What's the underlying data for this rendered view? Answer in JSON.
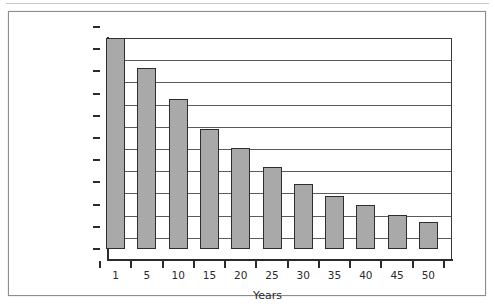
{
  "figure": {
    "background_color": "#ffffff",
    "frame_color": "#8d8d8d",
    "bar_fill_color": "#a9a9a9",
    "bar_edge_color": "#2e2e2e",
    "axis_color": "#2b2b2b",
    "gridline_color": "#5a5a5a"
  },
  "chart_data": {
    "type": "bar",
    "title": "",
    "subtitle": "",
    "xlabel": "Years",
    "ylabel": "",
    "categories": [
      "1",
      "5",
      "10",
      "15",
      "20",
      "25",
      "30",
      "35",
      "40",
      "45",
      "50"
    ],
    "values": [
      95000,
      81500,
      67500,
      54000,
      45500,
      37000,
      29500,
      24000,
      20000,
      15500,
      12000
    ],
    "ylim": [
      0,
      100000
    ],
    "ytick_values": [
      0,
      10000,
      20000,
      30000,
      40000,
      50000,
      60000,
      70000,
      80000,
      90000,
      100000
    ],
    "ytick_labels": [
      "$0",
      "$10,000",
      "$20,000",
      "$30,000",
      "$40,000",
      "$50,000",
      "$60,000",
      "$70,000",
      "$80,000",
      "$90,000",
      "$100,000"
    ],
    "xtick_labels": [
      "1",
      "5",
      "10",
      "15",
      "20",
      "25",
      "30",
      "35",
      "40",
      "45",
      "50"
    ],
    "grid": true,
    "grid_axis": "y",
    "legend": false,
    "legend_entries": [],
    "annotations": []
  }
}
